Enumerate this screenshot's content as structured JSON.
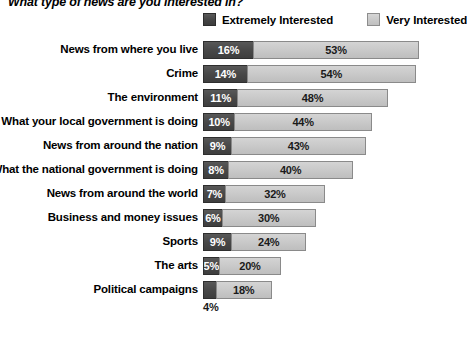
{
  "title": "What type of news are you interested in?",
  "legend": {
    "items": [
      {
        "label": "Extremely Interested",
        "color": "#484848",
        "key": "extremely"
      },
      {
        "label": "Very Interested",
        "color": "#c9c9c9",
        "key": "very"
      }
    ]
  },
  "chart_data": {
    "type": "bar",
    "orientation": "horizontal",
    "stacked": true,
    "title": "What type of news are you interested in?",
    "xlabel": "",
    "ylabel": "",
    "xlim": [
      0,
      69
    ],
    "grid": false,
    "legend_position": "top-right",
    "value_suffix": "%",
    "categories": [
      "News from where you live",
      "Crime",
      "The environment",
      "What your local government is doing",
      "News from around the nation",
      "What the national government is doing",
      "News from around the world",
      "Business and money issues",
      "Sports",
      "The arts",
      "Political campaigns"
    ],
    "series": [
      {
        "name": "Extremely Interested",
        "color": "#484848",
        "values": [
          16,
          14,
          11,
          10,
          9,
          8,
          7,
          6,
          9,
          5,
          4
        ],
        "labels": [
          "16%",
          "14%",
          "11%",
          "10%",
          "9%",
          "8%",
          "7%",
          "6%",
          "9%",
          "5%",
          "4%"
        ],
        "label_outside": [
          false,
          false,
          false,
          false,
          false,
          false,
          false,
          false,
          false,
          false,
          true
        ]
      },
      {
        "name": "Very Interested",
        "color": "#c9c9c9",
        "values": [
          53,
          54,
          48,
          44,
          43,
          40,
          32,
          30,
          24,
          20,
          18
        ],
        "labels": [
          "53%",
          "54%",
          "48%",
          "44%",
          "43%",
          "40%",
          "32%",
          "30%",
          "24%",
          "20%",
          "18%"
        ],
        "label_outside": [
          false,
          false,
          false,
          false,
          false,
          false,
          false,
          false,
          false,
          false,
          false
        ]
      }
    ],
    "totals": [
      69,
      68,
      59,
      54,
      52,
      48,
      39,
      36,
      33,
      25,
      22
    ]
  }
}
